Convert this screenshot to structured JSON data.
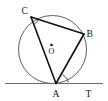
{
  "figure": {
    "name": "circle-with-inscribed-triangle-and-tangent",
    "background_color": "#ffffff",
    "width": 108,
    "height": 101,
    "labels": {
      "vertex_c": "C",
      "vertex_b": "B",
      "vertex_a": "A",
      "point_t": "T",
      "center_o": "O"
    },
    "geometry": {
      "circle": {
        "cx": 52.5,
        "cy": 49.5,
        "r": 34.0
      },
      "center_dot": {
        "cx": 51.5,
        "cy": 45.0,
        "r": 1.3
      },
      "points": {
        "C": {
          "x": 31.0,
          "y": 17.0
        },
        "B": {
          "x": 84.0,
          "y": 34.0
        },
        "A": {
          "x": 56.0,
          "y": 83.5
        },
        "T": {
          "x": 89.0,
          "y": 83.5
        }
      },
      "tangent": {
        "x1": 5.0,
        "y1": 83.5,
        "x2": 103.0,
        "y2": 83.5
      },
      "chords": [
        {
          "name": "CB",
          "x1": 31.0,
          "y1": 17.0,
          "x2": 84.0,
          "y2": 34.0
        },
        {
          "name": "CA",
          "x1": 31.0,
          "y1": 17.0,
          "x2": 56.0,
          "y2": 83.5
        },
        {
          "name": "AB",
          "x1": 56.0,
          "y1": 83.5,
          "x2": 84.0,
          "y2": 34.0
        }
      ],
      "angle_marks": [
        {
          "name": "angle-at-C",
          "d": "M 34.3 23.9 A 7.5 7.5 0 0 0 38.3 19.4"
        },
        {
          "name": "angle-at-A",
          "d": "M 64.0 74.1 A 11.5 11.5 0 0 1 67.5 82.0"
        }
      ]
    },
    "label_positions": {
      "C": {
        "x": 21.5,
        "y": 14.0
      },
      "B": {
        "x": 86.5,
        "y": 36.5
      },
      "A": {
        "x": 52.5,
        "y": 96.5
      },
      "T": {
        "x": 85.5,
        "y": 96.5
      },
      "O": {
        "x": 48.5,
        "y": 54.0
      }
    },
    "colors": {
      "circle_stroke": "#4a4a4a",
      "tangent_stroke": "#6a6a6a",
      "chord_stroke": "#111111",
      "label_fill": "#111111"
    }
  }
}
